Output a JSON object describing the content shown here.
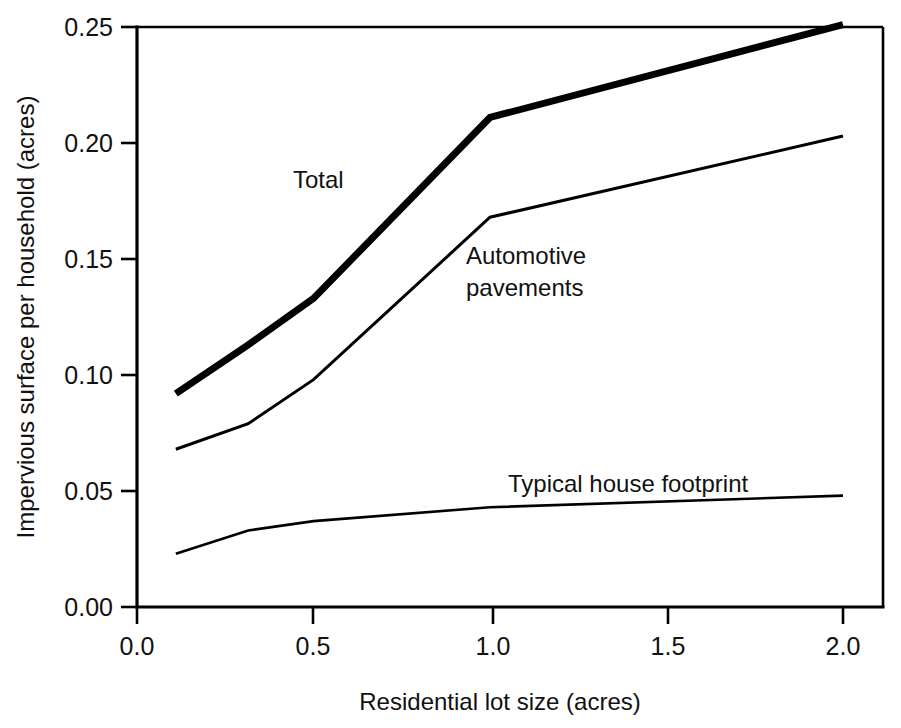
{
  "chart_data": {
    "type": "line",
    "title": "",
    "subtitle": "",
    "xlabel": "Residential lot size (acres)",
    "ylabel": "Impervious surface  per household (acres)",
    "xlim": [
      0.0,
      2.0
    ],
    "ylim": [
      0.0,
      0.25
    ],
    "xticks": [
      0.0,
      0.5,
      1.0,
      1.5,
      2.0
    ],
    "xtick_labels": [
      "0.0",
      "0.5",
      "1.0",
      "1.5",
      "2.0"
    ],
    "yticks": [
      0.0,
      0.05,
      0.1,
      0.15,
      0.2,
      0.25
    ],
    "ytick_labels": [
      "0.00",
      "0.05",
      "0.10",
      "0.15",
      "0.20",
      "0.25"
    ],
    "grid": false,
    "legend": "inline-annotations",
    "legend_position": "inline",
    "series": [
      {
        "name": "Total",
        "label": "Total",
        "line_weight": "thick",
        "x": [
          0.11,
          0.315,
          0.5,
          1.0,
          2.0
        ],
        "values": [
          0.092,
          0.113,
          0.133,
          0.211,
          0.251
        ]
      },
      {
        "name": "Automotive pavements",
        "label": "Automotive\npavements",
        "line_weight": "thin",
        "x": [
          0.11,
          0.315,
          0.5,
          1.0,
          2.0
        ],
        "values": [
          0.068,
          0.079,
          0.098,
          0.168,
          0.203
        ]
      },
      {
        "name": "Typical house footprint",
        "label": "Typical house footprint",
        "line_weight": "thin",
        "x": [
          0.11,
          0.315,
          0.5,
          1.0,
          2.0
        ],
        "values": [
          0.023,
          0.033,
          0.037,
          0.043,
          0.048
        ]
      }
    ],
    "annotations": [
      {
        "text": "Total",
        "x": 0.45,
        "y": 0.185
      },
      {
        "text": "Automotive",
        "x": 0.93,
        "y": 0.147
      },
      {
        "text": "pavements",
        "x": 0.93,
        "y": 0.132
      },
      {
        "text": "Typical house footprint",
        "x": 1.06,
        "y": 0.057
      }
    ]
  },
  "axes": {
    "x_title": "Residential lot size (acres)",
    "y_title": "Impervious surface  per household (acres)",
    "x_tick_0": "0.0",
    "x_tick_1": "0.5",
    "x_tick_2": "1.0",
    "x_tick_3": "1.5",
    "x_tick_4": "2.0",
    "y_tick_0": "0.00",
    "y_tick_1": "0.05",
    "y_tick_2": "0.10",
    "y_tick_3": "0.15",
    "y_tick_4": "0.20",
    "y_tick_5": "0.25"
  },
  "labels": {
    "total": "Total",
    "automotive_line1": "Automotive",
    "automotive_line2": "pavements",
    "house": "Typical house footprint"
  },
  "colors": {
    "line": "#000000",
    "background": "#ffffff",
    "text": "#111111"
  }
}
